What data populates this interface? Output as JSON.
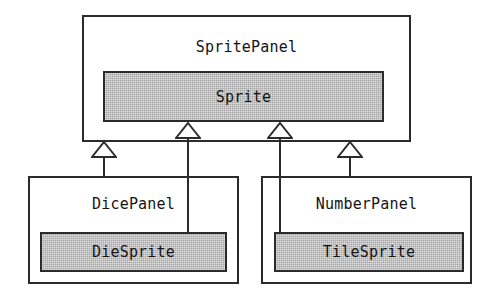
{
  "diagram": {
    "type": "uml-class-diagram",
    "colors": {
      "stroke": "#2b2b2b",
      "text": "#141414",
      "background": "#ffffff",
      "shaded_fill": "#b9b9b9"
    },
    "boxes": [
      {
        "id": "sprite-panel",
        "label": "SpritePanel",
        "kind": "outer-panel",
        "shaded": false,
        "x": 82,
        "y": 15,
        "width": 329,
        "height": 127
      },
      {
        "id": "sprite",
        "label": "Sprite",
        "kind": "inner-class",
        "shaded": true,
        "x": 103,
        "y": 71,
        "width": 281,
        "height": 51
      },
      {
        "id": "dice-panel",
        "label": "DicePanel",
        "kind": "outer-panel",
        "shaded": false,
        "x": 28,
        "y": 176,
        "width": 211,
        "height": 108
      },
      {
        "id": "die-sprite",
        "label": "DieSprite",
        "kind": "inner-class",
        "shaded": true,
        "x": 40,
        "y": 232,
        "width": 187,
        "height": 40
      },
      {
        "id": "number-panel",
        "label": "NumberPanel",
        "kind": "outer-panel",
        "shaded": false,
        "x": 261,
        "y": 176,
        "width": 211,
        "height": 108
      },
      {
        "id": "tile-sprite",
        "label": "TileSprite",
        "kind": "inner-class",
        "shaded": true,
        "x": 274,
        "y": 232,
        "width": 190,
        "height": 40
      }
    ],
    "generalizations": [
      {
        "id": "dice-panel-to-sprite-panel",
        "from": "DicePanel",
        "to": "SpritePanel",
        "relation": "generalization",
        "arrow_x": 104,
        "arrow_tip_y": 141,
        "line_bottom_y": 176
      },
      {
        "id": "die-sprite-to-sprite",
        "from": "DieSprite",
        "to": "Sprite",
        "relation": "generalization",
        "arrow_x": 188,
        "arrow_tip_y": 122,
        "line_bottom_y": 232
      },
      {
        "id": "tile-sprite-to-sprite",
        "from": "TileSprite",
        "to": "Sprite",
        "relation": "generalization",
        "arrow_x": 280,
        "arrow_tip_y": 122,
        "line_bottom_y": 232
      },
      {
        "id": "number-panel-to-sprite-panel",
        "from": "NumberPanel",
        "to": "SpritePanel",
        "relation": "generalization",
        "arrow_x": 350,
        "arrow_tip_y": 141,
        "line_bottom_y": 176
      }
    ]
  }
}
